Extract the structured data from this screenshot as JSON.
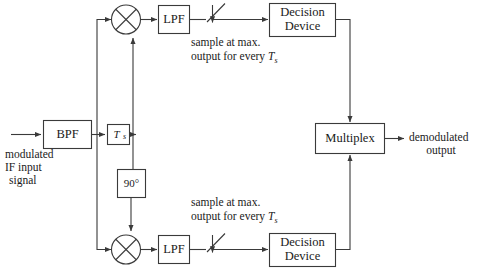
{
  "diagram": {
    "colors": {
      "stroke": "#3a3a3a",
      "text": "#1a1a1a",
      "background": "#ffffff"
    },
    "blocks": {
      "bpf": {
        "label": "BPF"
      },
      "ts": {
        "label": "T",
        "sub": "s"
      },
      "phase_shift": {
        "label": "90°"
      },
      "lpf_top": {
        "label": "LPF"
      },
      "lpf_bottom": {
        "label": "LPF"
      },
      "decision_top": {
        "line1": "Decision",
        "line2": "Device"
      },
      "decision_bottom": {
        "line1": "Decision",
        "line2": "Device"
      },
      "multiplex": {
        "label": "Multiplex"
      },
      "mixer_top": {
        "label": "multiplier"
      },
      "mixer_bottom": {
        "label": "multiplier"
      }
    },
    "annotations": {
      "input_label": {
        "line1": "modulated",
        "line2": "IF input",
        "line3": "signal"
      },
      "output_label": {
        "line1": "demodulated",
        "line2": "output"
      },
      "sampler_top": {
        "line1": "sample at max.",
        "line2_pre": "output for every ",
        "line2_var": "T",
        "line2_sub": "s"
      },
      "sampler_bottom": {
        "line1": "sample at max.",
        "line2_pre": "output for every ",
        "line2_var": "T",
        "line2_sub": "s"
      }
    }
  }
}
